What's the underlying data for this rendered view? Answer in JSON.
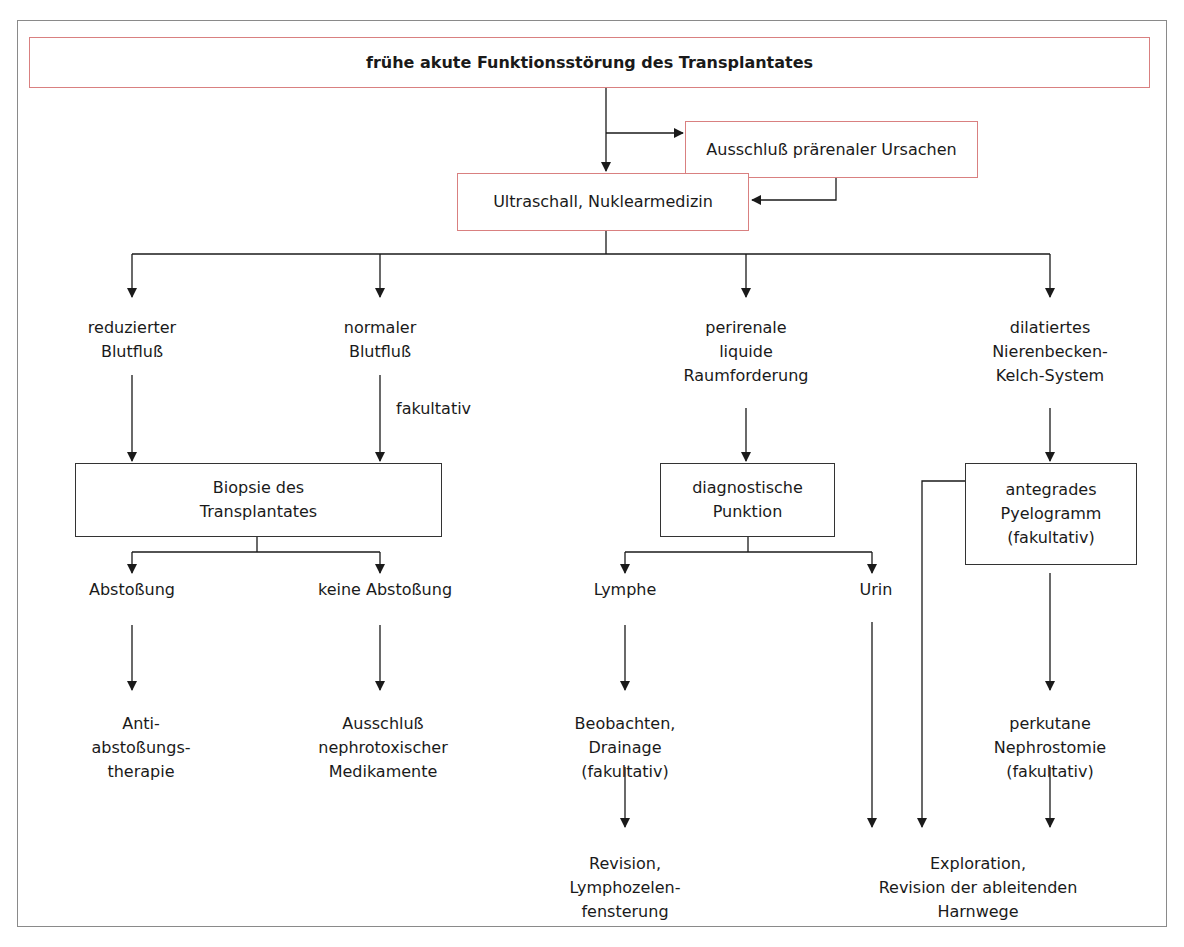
{
  "diagram": {
    "title": "frühe akute Funktionsstörung des Transplantates",
    "colors": {
      "accent_border": "#d98080",
      "box_border": "#333333",
      "frame_border": "#8a8a8a",
      "line": "#1a1a1a"
    },
    "nodes": {
      "prerenal": "Ausschluß prärenaler Ursachen",
      "imaging": "Ultraschall, Nuklearmedizin",
      "reduced_flow": "reduzierter\nBlutfluß",
      "normal_flow": "normaler\nBlutfluß",
      "perirenal": "perirenale\nliquide\nRaumforderung",
      "dilated": "dilatiertes\nNierenbecken-\nKelch-System",
      "optional_label": "fakultativ",
      "biopsy": "Biopsie des\nTransplantates",
      "puncture": "diagnostische\nPunktion",
      "pyelogram": "antegrades\nPyelogramm\n(fakultativ)",
      "rejection": "Abstoßung",
      "no_rejection": "keine Abstoßung",
      "lymph": "Lymphe",
      "urine": "Urin",
      "anti_rejection": "Anti-\nabstoßungs-\ntherapie",
      "exclude_nephrotoxic": "Ausschluß\nnephrotoxischer\nMedikamente",
      "observe_drain": "Beobachten,\nDrainage\n(fakultativ)",
      "nephrostomy": "perkutane\nNephrostomie\n(fakultativ)",
      "lymphocele_revision": "Revision,\nLymphozelen-\nfensterung",
      "exploration": "Exploration,\nRevision der ableitenden\nHarnwege"
    }
  }
}
